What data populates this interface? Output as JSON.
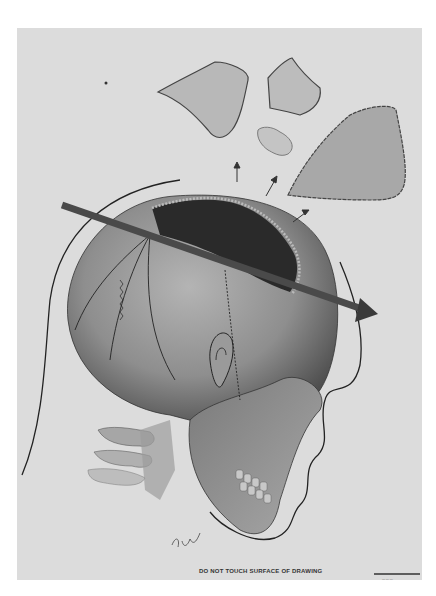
{
  "figure": {
    "caption": "DO NOT TOUCH SURFACE OF DRAWING",
    "signature": "Dhy",
    "scale_note": "— — —",
    "elements": [
      "skull-lateral-view",
      "trajectory-arrow",
      "bone-fragment-1",
      "bone-fragment-2",
      "bone-fragment-3",
      "bone-fragment-4",
      "fragment-direction-arrows",
      "head-profile-outline",
      "cervical-vertebrae"
    ],
    "colors": {
      "paper": "#dcdcdc",
      "skull": "#8f8f8f",
      "wound": "#2a2a2a",
      "arrow": "#4a4a4a",
      "outline": "#222222"
    }
  }
}
